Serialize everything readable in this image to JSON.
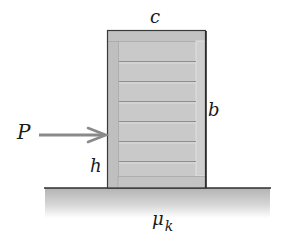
{
  "figure": {
    "type": "mechanics-diagram",
    "labels": {
      "width": "c",
      "height": "b",
      "force": "P",
      "force_height": "h",
      "friction_symbol": "μ",
      "friction_subscript": "k"
    },
    "colors": {
      "crate_fill": "#c9c9c9",
      "crate_frame": "#bdbdbd",
      "crate_outline": "#3a3a3a",
      "plank_line": "#8f8f8f",
      "arrow": "#8a8a8a",
      "ground_line": "#2f2f2f",
      "ground_top": "#b5b5b5",
      "ground_bottom": "#ffffff",
      "text": "#1a1a1a"
    }
  }
}
